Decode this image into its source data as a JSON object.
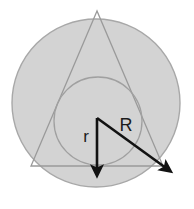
{
  "figure": {
    "background_color": "#ffffff",
    "canvas": {
      "width": 194,
      "height": 209
    }
  },
  "colors": {
    "shape_fill": "#d3d3d3",
    "shape_stroke": "#a8a8a8",
    "inner_circle_stroke": "#a0a0a0",
    "triangle_stroke": "#9a9a9a",
    "arrow_color": "#121212",
    "label_color": "#1c1c1c"
  },
  "shapes": {
    "outer_circle": {
      "name": "circumscribed-circle",
      "cx": 96,
      "cy": 103,
      "r": 84,
      "fill": "#d3d3d3",
      "stroke": "#a8a8a8",
      "stroke_width": 1.4
    },
    "triangle": {
      "name": "equilateral-triangle",
      "points": "97,11 31,166 163,166",
      "fill": "none",
      "stroke": "#9a9a9a",
      "stroke_width": 1.3
    },
    "inner_circle": {
      "name": "inscribed-circle",
      "cx": 98,
      "cy": 121,
      "r": 44,
      "fill": "none",
      "stroke": "#a0a0a0",
      "stroke_width": 1.3
    }
  },
  "arrows": {
    "r_arrow": {
      "name": "inradius-arrow",
      "label": "r",
      "from_x": 97,
      "from_y": 118,
      "to_x": 97,
      "to_y": 170,
      "stroke_width": 2.6,
      "label_x": 86,
      "label_y": 142,
      "label_font_size": 17
    },
    "R_arrow": {
      "name": "circumradius-arrow",
      "label": "R",
      "from_x": 97,
      "from_y": 118,
      "to_x": 166,
      "to_y": 168,
      "stroke_width": 2.6,
      "label_x": 126,
      "label_y": 131,
      "label_font_size": 18
    }
  },
  "chart_data": {
    "type": "diagram",
    "elements": [
      {
        "kind": "circle",
        "role": "circumscribed",
        "center": [
          96,
          103
        ],
        "radius": 84,
        "label": ""
      },
      {
        "kind": "polygon",
        "role": "equilateral-triangle",
        "vertices": [
          [
            97,
            11
          ],
          [
            31,
            166
          ],
          [
            163,
            166
          ]
        ]
      },
      {
        "kind": "circle",
        "role": "inscribed",
        "center": [
          98,
          121
        ],
        "radius": 44,
        "label": ""
      },
      {
        "kind": "vector",
        "role": "inradius",
        "label": "r",
        "start": [
          97,
          118
        ],
        "end": [
          97,
          170
        ]
      },
      {
        "kind": "vector",
        "role": "circumradius",
        "label": "R",
        "start": [
          97,
          118
        ],
        "end": [
          166,
          168
        ]
      }
    ],
    "annotations": [
      "r",
      "R"
    ]
  }
}
